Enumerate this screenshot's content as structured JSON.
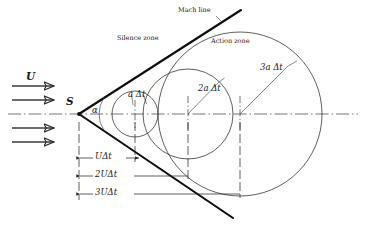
{
  "diagram": {
    "type": "schematic",
    "canvas": {
      "width": 366,
      "height": 227,
      "background": "#ffffff"
    },
    "colors": {
      "ink": "#1a1a1a",
      "thin_line": "#2b2b2b",
      "thick_line": "#0d0d0d",
      "axis": "#3a3a3a",
      "leader": "#3a3a3a"
    }
  },
  "labels": {
    "mach_line": "Mach line",
    "silence_zone": "Silence zone",
    "action_zone": "Action zone",
    "source_point": "S",
    "mach_angle": "α",
    "freestream_velocity": "U",
    "circle1": "a  Δt",
    "circle2": "2a  Δt",
    "circle3": "3a  Δt",
    "dim1": "UΔt",
    "dim2": "2UΔt",
    "dim3": "3UΔt"
  },
  "geometry": {
    "apex": {
      "x": 79,
      "y": 114
    },
    "axis_y": 114,
    "axis_x_start": 8,
    "axis_x_end": 358,
    "mach_half_angle_deg": 33,
    "mach_line_upper_end": {
      "x": 241,
      "y": 10
    },
    "mach_line_lower_end": {
      "x": 233,
      "y": 218
    },
    "wave_circles": [
      {
        "name": "circle-a-dt",
        "center_x": 135,
        "center_y": 114,
        "radius": 23,
        "label": "a  Δt"
      },
      {
        "name": "circle-2a-dt",
        "center_x": 188,
        "center_y": 114,
        "radius": 45,
        "label": "2a  Δt"
      },
      {
        "name": "circle-3a-dt",
        "center_x": 240,
        "center_y": 114,
        "radius": 82,
        "label": "3a  Δt"
      }
    ],
    "dimension_lines": [
      {
        "name": "dim-U-dt",
        "y": 158,
        "x_from": 79,
        "x_to": 140,
        "label": "UΔt"
      },
      {
        "name": "dim-2U-dt",
        "y": 176,
        "x_from": 79,
        "x_to": 189,
        "label": "2UΔt"
      },
      {
        "name": "dim-3U-dt",
        "y": 194,
        "x_from": 79,
        "x_to": 241,
        "label": "3UΔt"
      }
    ],
    "flow_arrows": [
      {
        "name": "flow-arrow-1",
        "y": 86,
        "x_from": 12,
        "x_to": 56
      },
      {
        "name": "flow-arrow-2",
        "y": 100,
        "x_from": 12,
        "x_to": 56
      },
      {
        "name": "flow-arrow-3",
        "y": 128,
        "x_from": 12,
        "x_to": 56
      },
      {
        "name": "flow-arrow-4",
        "y": 142,
        "x_from": 12,
        "x_to": 56
      }
    ]
  }
}
